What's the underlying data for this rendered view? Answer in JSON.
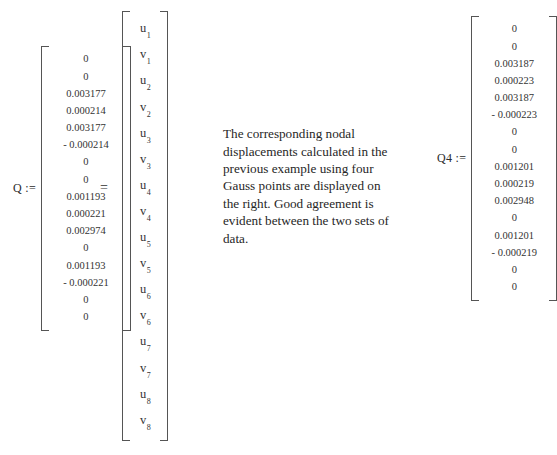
{
  "q_vector": {
    "label": "Q :=",
    "values": [
      "0",
      "0",
      "0.003177",
      "0.000214",
      "0.003177",
      "- 0.000214",
      "0",
      "0",
      "0.001193",
      "0.000221",
      "0.002974",
      "0",
      "0.001193",
      "- 0.000221",
      "0",
      "0"
    ]
  },
  "equals": "=",
  "unknowns_vector": {
    "symbols": [
      {
        "base": "u",
        "sub": "1"
      },
      {
        "base": "v",
        "sub": "1"
      },
      {
        "base": "u",
        "sub": "2"
      },
      {
        "base": "v",
        "sub": "2"
      },
      {
        "base": "u",
        "sub": "3"
      },
      {
        "base": "v",
        "sub": "3"
      },
      {
        "base": "u",
        "sub": "4"
      },
      {
        "base": "v",
        "sub": "4"
      },
      {
        "base": "u",
        "sub": "5"
      },
      {
        "base": "v",
        "sub": "5"
      },
      {
        "base": "u",
        "sub": "6"
      },
      {
        "base": "v",
        "sub": "6"
      },
      {
        "base": "u",
        "sub": "7"
      },
      {
        "base": "v",
        "sub": "7"
      },
      {
        "base": "u",
        "sub": "8"
      },
      {
        "base": "v",
        "sub": "8"
      }
    ]
  },
  "description": {
    "text": "The corresponding nodal displacements calculated in the previous example using four Gauss points are displayed on the right. Good agreement is evident between the two sets of data."
  },
  "q4_vector": {
    "label": "Q4 :=",
    "values": [
      "0",
      "0",
      "0.003187",
      "0.000223",
      "0.003187",
      "- 0.000223",
      "0",
      "0",
      "0.001201",
      "0.000219",
      "0.002948",
      "0",
      "0.001201",
      "- 0.000219",
      "0",
      "0"
    ]
  },
  "colors": {
    "page_background": "#ffffff",
    "text": "#2b2b2b",
    "bracket": "#555555"
  }
}
